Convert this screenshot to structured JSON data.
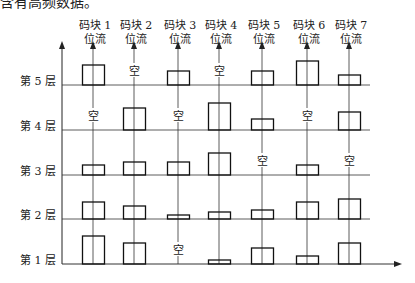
{
  "caption_fragment": "含有高频数据。",
  "columns": [
    {
      "name": "码块 1",
      "sub": "位流"
    },
    {
      "name": "码块 2",
      "sub": "位流"
    },
    {
      "name": "码块 3",
      "sub": "位流"
    },
    {
      "name": "码块 4",
      "sub": "位流"
    },
    {
      "name": "码块 5",
      "sub": "位流"
    },
    {
      "name": "码块 6",
      "sub": "位流"
    },
    {
      "name": "码块 7",
      "sub": "位流"
    }
  ],
  "layers": [
    "第 5 层",
    "第 4 层",
    "第 3 层",
    "第 2 层",
    "第 1 层"
  ],
  "empty_label": "空",
  "grid": {
    "layer_heights": {
      "L5": [
        20,
        0,
        14,
        0,
        14,
        24,
        10
      ],
      "L4": [
        0,
        22,
        0,
        27,
        11,
        0,
        18
      ],
      "L3": [
        10,
        13,
        13,
        22,
        0,
        10,
        0
      ],
      "L2": [
        17,
        13,
        4,
        7,
        9,
        17,
        20
      ],
      "L1": [
        28,
        21,
        0,
        4,
        16,
        8,
        21
      ]
    }
  }
}
